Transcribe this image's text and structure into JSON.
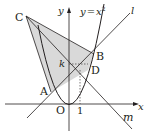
{
  "diagram": {
    "type": "coordinate-geometry",
    "curve_label": "y = x²",
    "curve_label_parts": {
      "lhs": "y",
      "eq": "=",
      "rhs": "x",
      "sup": "2"
    },
    "axes": {
      "x_label": "x",
      "y_label": "y",
      "origin_label": "O",
      "tick_label": "1"
    },
    "points": [
      {
        "id": "A",
        "label": "A"
      },
      {
        "id": "B",
        "label": "B"
      },
      {
        "id": "C",
        "label": "C"
      },
      {
        "id": "D",
        "label": "D"
      }
    ],
    "lines": [
      {
        "id": "l",
        "label": "l"
      },
      {
        "id": "m",
        "label": "m"
      }
    ],
    "k_label": "k",
    "colors": {
      "shade": "#d9d9d9",
      "stroke": "#231f20"
    }
  }
}
